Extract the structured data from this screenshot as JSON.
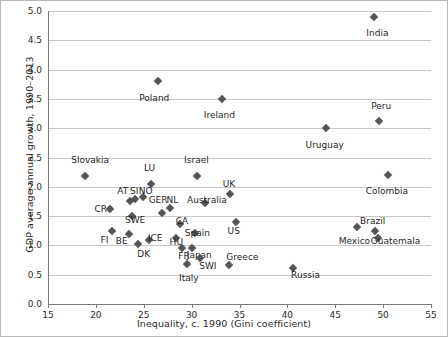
{
  "chart_data": {
    "type": "scatter",
    "title": "",
    "xlabel": "Inequality, c. 1990 (Gini coefficient)",
    "ylabel": "GDP average annual growth, 1990–2013",
    "xlim": [
      15,
      55
    ],
    "ylim": [
      0.0,
      5.0
    ],
    "xticks": [
      "15",
      "20",
      "25",
      "30",
      "35",
      "40",
      "45",
      "50",
      "55"
    ],
    "yticks": [
      "0.0",
      "0.5",
      "1.0",
      "1.5",
      "2.0",
      "2.5",
      "3.0",
      "3.5",
      "4.0",
      "4.5",
      "5.0"
    ],
    "grid": "horizontal",
    "legend": "none",
    "marker": "diamond",
    "marker_color": "#555558",
    "grid_color": "#c8c8c8",
    "axis_color": "#7a7a7a",
    "points": [
      {
        "label": "India",
        "x": 49.0,
        "y": 4.9,
        "lx": 49.4,
        "ly": 4.62
      },
      {
        "label": "Poland",
        "x": 26.5,
        "y": 3.8,
        "lx": 26.1,
        "ly": 3.52
      },
      {
        "label": "Ireland",
        "x": 33.2,
        "y": 3.5,
        "lx": 32.9,
        "ly": 3.22
      },
      {
        "label": "Peru",
        "x": 49.6,
        "y": 3.12,
        "lx": 49.8,
        "ly": 3.38
      },
      {
        "label": "Uruguay",
        "x": 44.0,
        "y": 3.0,
        "lx": 43.9,
        "ly": 2.72
      },
      {
        "label": "Slovakia",
        "x": 18.9,
        "y": 2.18,
        "lx": 19.4,
        "ly": 2.45
      },
      {
        "label": "Israel",
        "x": 30.6,
        "y": 2.18,
        "lx": 30.5,
        "ly": 2.45
      },
      {
        "label": "Colombia",
        "x": 50.5,
        "y": 2.2,
        "lx": 50.4,
        "ly": 1.92
      },
      {
        "label": "LU",
        "x": 25.8,
        "y": 2.05,
        "lx": 25.6,
        "ly": 2.32
      },
      {
        "label": "NO",
        "x": 24.9,
        "y": 1.82,
        "lx": 25.2,
        "ly": 1.92
      },
      {
        "label": "SI",
        "x": 24.1,
        "y": 1.8,
        "lx": 24.0,
        "ly": 1.93
      },
      {
        "label": "AT",
        "x": 23.6,
        "y": 1.76,
        "lx": 22.8,
        "ly": 1.93
      },
      {
        "label": "CR",
        "x": 21.5,
        "y": 1.62,
        "lx": 20.5,
        "ly": 1.62
      },
      {
        "label": "NL",
        "x": 27.7,
        "y": 1.63,
        "lx": 28.0,
        "ly": 1.78
      },
      {
        "label": "GER",
        "x": 26.9,
        "y": 1.55,
        "lx": 26.5,
        "ly": 1.78
      },
      {
        "label": "Australia",
        "x": 31.4,
        "y": 1.73,
        "lx": 31.6,
        "ly": 1.78
      },
      {
        "label": "UK",
        "x": 34.0,
        "y": 1.88,
        "lx": 33.9,
        "ly": 2.05
      },
      {
        "label": "SWE",
        "x": 23.8,
        "y": 1.5,
        "lx": 24.1,
        "ly": 1.44
      },
      {
        "label": "CA",
        "x": 28.8,
        "y": 1.36,
        "lx": 29.0,
        "ly": 1.42
      },
      {
        "label": "US",
        "x": 34.6,
        "y": 1.4,
        "lx": 34.4,
        "ly": 1.25
      },
      {
        "label": "Spain",
        "x": 30.4,
        "y": 1.22,
        "lx": 30.6,
        "ly": 1.22
      },
      {
        "label": "FI",
        "x": 21.7,
        "y": 1.24,
        "lx": 20.9,
        "ly": 1.1
      },
      {
        "label": "BE",
        "x": 23.5,
        "y": 1.2,
        "lx": 22.7,
        "ly": 1.08
      },
      {
        "label": "ICE",
        "x": 25.5,
        "y": 1.1,
        "lx": 26.2,
        "ly": 1.12
      },
      {
        "label": "HU",
        "x": 28.4,
        "y": 1.12,
        "lx": 28.4,
        "ly": 1.06
      },
      {
        "label": "DK",
        "x": 24.4,
        "y": 1.02,
        "lx": 25.0,
        "ly": 0.86
      },
      {
        "label": "FR",
        "x": 29.0,
        "y": 0.95,
        "lx": 29.2,
        "ly": 0.82
      },
      {
        "label": "Japan",
        "x": 30.0,
        "y": 0.96,
        "lx": 30.8,
        "ly": 0.84
      },
      {
        "label": "SWI",
        "x": 30.9,
        "y": 0.78,
        "lx": 31.7,
        "ly": 0.64
      },
      {
        "label": "Italy",
        "x": 29.5,
        "y": 0.68,
        "lx": 29.7,
        "ly": 0.45
      },
      {
        "label": "Greece",
        "x": 33.9,
        "y": 0.66,
        "lx": 35.3,
        "ly": 0.8
      },
      {
        "label": "Russia",
        "x": 40.6,
        "y": 0.62,
        "lx": 41.9,
        "ly": 0.5
      },
      {
        "label": "Mexico",
        "x": 47.3,
        "y": 1.32,
        "lx": 47.0,
        "ly": 1.08
      },
      {
        "label": "Brazil",
        "x": 49.2,
        "y": 1.25,
        "lx": 48.9,
        "ly": 1.42
      },
      {
        "label": "Guatemala",
        "x": 49.5,
        "y": 1.12,
        "lx": 51.3,
        "ly": 1.08
      }
    ]
  }
}
